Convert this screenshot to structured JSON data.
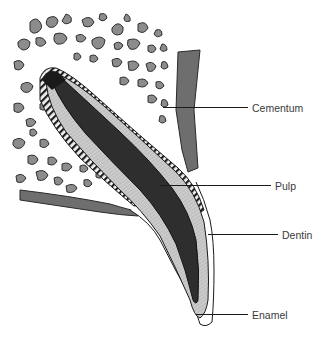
{
  "diagram": {
    "labels": [
      {
        "id": "cementum",
        "text": "Cementum",
        "x": 252,
        "y": 102,
        "line_x1": 163,
        "line_x2": 248,
        "line_y": 108
      },
      {
        "id": "pulp",
        "text": "Pulp",
        "x": 275,
        "y": 180,
        "line_x1": 160,
        "line_x2": 271,
        "line_y": 186
      },
      {
        "id": "dentin",
        "text": "Dentin",
        "x": 282,
        "y": 229,
        "line_x1": 208,
        "line_x2": 278,
        "line_y": 235
      },
      {
        "id": "enamel",
        "text": "Enamel",
        "x": 252,
        "y": 309,
        "line_x1": 196,
        "line_x2": 248,
        "line_y": 315
      }
    ],
    "colors": {
      "bone_trabeculae": "#8a8a8a",
      "bone_outline": "#3a3a3a",
      "gingiva": "#6e6e6e",
      "dentin": "#c8c8c8",
      "pulp": "#2e2e2e",
      "cementum_band": "#1e1e1e",
      "enamel": "#ffffff",
      "label_text": "#3a3a3a",
      "leader_line": "#1a1a1a"
    }
  }
}
